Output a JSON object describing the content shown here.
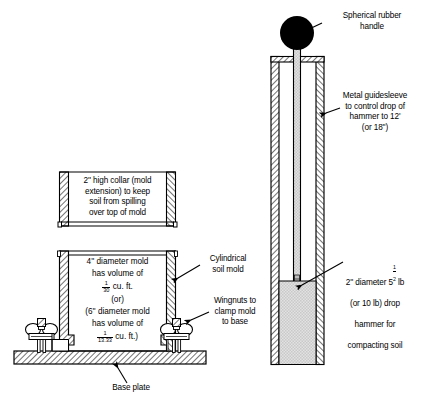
{
  "figure": {
    "type": "engineering-cross-section-diagram",
    "background_color": "#ffffff",
    "line_color": "#000000",
    "hatch_color": "#000000",
    "soil_fill_color": "#d9d9d9",
    "handle_color": "#000000"
  },
  "labels": {
    "collar": "2'' high collar (mold\nextension) to keep\nsoil from spilling\nover top of mold",
    "mold_line1": "4'' diameter mold",
    "mold_line2": "has volume of",
    "mold_frac1_num": "1",
    "mold_frac1_den": "30",
    "mold_units1": "cu. ft.",
    "mold_or": "(or)",
    "mold_line3": "(6'' diameter mold",
    "mold_line4": "has volume of",
    "mold_frac2_num": "1",
    "mold_frac2_den": "13.33",
    "mold_units2": "cu. ft.)",
    "cylindrical_soil_mold": "Cylindrical\nsoil mold",
    "wingnuts": "Wingnuts to\nclamp mold\nto base",
    "base_plate": "Base plate",
    "spherical_handle": "Spherical rubber\nhandle",
    "guidesleeve": "Metal guidesleeve\nto control drop of\nhammer to 12'\n(or 18'')",
    "hammer_pre": "2'' diameter 5",
    "hammer_frac_num": "1",
    "hammer_frac_den": "2",
    "hammer_post": " lb",
    "hammer_line2": "(or 10 lb) drop",
    "hammer_line3": "hammer for",
    "hammer_line4": "compacting soil"
  },
  "parts": {
    "collar": "mold-collar-extension",
    "mold": "cylindrical-soil-mold",
    "base_plate": "base-plate",
    "wingnut_left": "wingnut-left",
    "wingnut_right": "wingnut-right",
    "guidesleeve": "metal-guidesleeve",
    "hammer_rod": "hammer-rod",
    "handle": "spherical-rubber-handle",
    "soil": "compacted-soil"
  }
}
